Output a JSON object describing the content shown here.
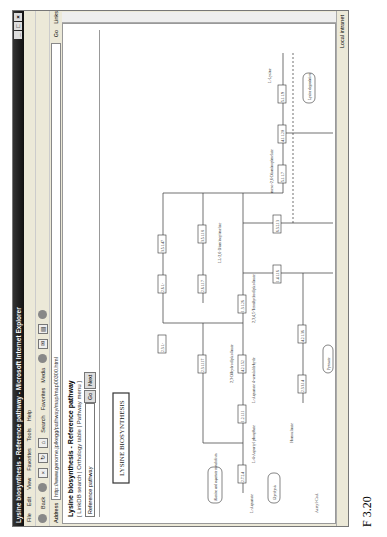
{
  "window": {
    "title": "Lysine biosynthesis - Reference pathway - Microsoft Internet Explorer",
    "controls": [
      "_",
      "□",
      "×"
    ]
  },
  "menu": [
    "File",
    "Edit",
    "View",
    "Favorites",
    "Tools",
    "Help"
  ],
  "toolbar": {
    "back": "Back",
    "search": "Search",
    "favorites": "Favorites",
    "media": "Media"
  },
  "address": {
    "label": "Address",
    "url": "http://www.genome.jp/kegg/pathway/map/map00300.html",
    "go": "Go",
    "links": "Links"
  },
  "page": {
    "title": "Lysine biosynthesis - Reference pathway",
    "links": "[ LinkDB search | Orthology table | Pathway menu ]",
    "select_value": "Reference pathway",
    "go_button": "Go",
    "next_button": "Next"
  },
  "map": {
    "title": "LYSINE BIOSYNTHESIS",
    "enzymes": [
      "2.7.2.4",
      "1.2.1.11",
      "4.2.1.52",
      "1.3.1.26",
      "2.3.1.117",
      "2.6.1.17",
      "3.5.1.18",
      "5.1.1.7",
      "4.1.1.20",
      "2.3.1.-",
      "2.6.1.-",
      "3.5.1.47",
      "1.4.1.16",
      "6.3.2.13",
      "6.3.2.10",
      "1.1.1.3",
      "2.3.3.14",
      "4.2.1.36",
      "1.1.1.87",
      "1.2.1.31",
      "1.5.1.10",
      "1.5.1.7",
      "1.5.1.8",
      "2.6.1.36",
      "5.1.1.9",
      "6.1.1.6",
      "2.3.1.-"
    ],
    "compounds": [
      "L-Aspartate",
      "L-4-Aspartyl phosphate",
      "L-Aspartate 4-semialdehyde",
      "2,3-Dihydrodipicolinate",
      "2,3,4,5-Tetrahydrodipicolinate",
      "N-Succinyl-2-amino-6-oxopimelate",
      "N-Succinyl-LL-2,6-diaminopimelate",
      "N-Acetyl-L-2-amino-6-oxopimelate",
      "N-Acetyl-LL-2,6-diaminopimelate",
      "LL-2,6-Diaminopimelate",
      "meso-2,6-Diaminopimelate",
      "L-Lysine",
      "D-Lysine",
      "L-2-Aminoadipate 6-semialdehyde",
      "L-Saccharopine",
      "L-Homoserine",
      "Homocitrate",
      "Homo-isocitrate",
      "2-Oxoglutarate",
      "Acetyl-CoA",
      "L-2-Aminoadipate",
      "L-Lysyl-tRNA(Lys)",
      "UDP-N-acetylmuramoyl-L-alanyl-D-glutamate",
      "UDP-N-acetylmuramoyl-L-alanyl-D-glutamyl-meso-2,6-diaminopimelate",
      "2,5-Diamine"
    ],
    "pathway_links": [
      "Glycine, serine and threonine metabolism",
      "Alanine and aspartate metabolism",
      "Glycolysis",
      "Pyruvate",
      "Lysine degradation"
    ]
  },
  "status": {
    "left": "",
    "zone": "Local intranet"
  },
  "caption": "F 3.20"
}
